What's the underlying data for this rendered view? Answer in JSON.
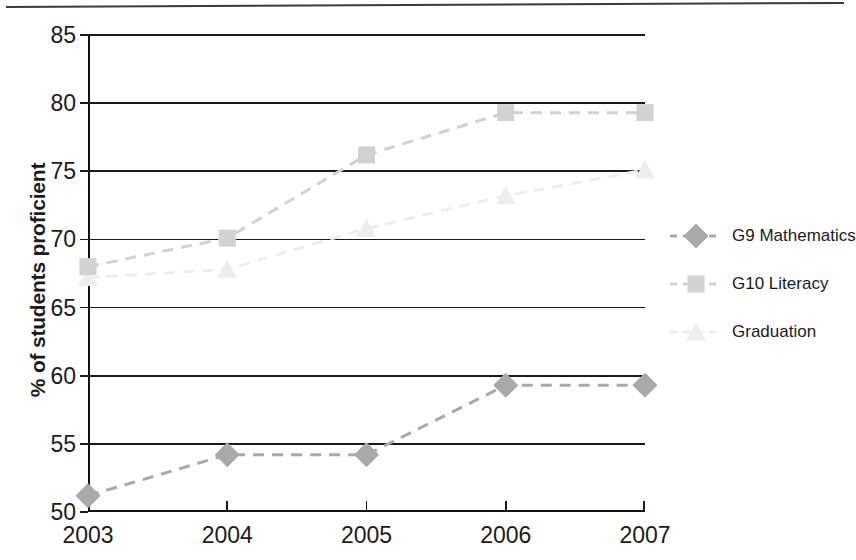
{
  "chart_data": {
    "type": "line",
    "title": "",
    "xlabel": "",
    "ylabel": "% of students proficient",
    "categories": [
      "2003",
      "2004",
      "2005",
      "2006",
      "2007"
    ],
    "x": [
      2003,
      2004,
      2005,
      2006,
      2007
    ],
    "ylim": [
      50,
      85
    ],
    "xlim": [
      2003,
      2007
    ],
    "yticks": [
      50,
      55,
      60,
      65,
      70,
      75,
      80,
      85
    ],
    "ytick_labels": [
      "50",
      "55",
      "60",
      "65",
      "70",
      "75",
      "80",
      "85"
    ],
    "grid": "horizontal",
    "legend_position": "right",
    "series": [
      {
        "name": "G9 Mathematics",
        "values": [
          51.2,
          54.2,
          54.2,
          59.3,
          59.3
        ],
        "marker": "diamond",
        "color": "#a9a9a9",
        "line_style": "dashed"
      },
      {
        "name": "G10 Literacy",
        "values": [
          68.0,
          70.1,
          76.2,
          79.3,
          79.3
        ],
        "marker": "square",
        "color": "#d2d2d2",
        "line_style": "dashed"
      },
      {
        "name": "Graduation",
        "values": [
          67.2,
          67.8,
          70.8,
          73.2,
          75.1
        ],
        "marker": "triangle",
        "color": "#ededed",
        "line_style": "dashed"
      }
    ]
  },
  "axis": {
    "y_title": "% of students proficient"
  },
  "legend": {
    "items": [
      {
        "label": "G9 Mathematics"
      },
      {
        "label": "G10 Literacy"
      },
      {
        "label": "Graduation"
      }
    ]
  }
}
